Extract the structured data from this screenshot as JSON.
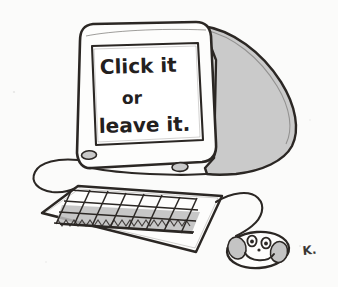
{
  "artwork": {
    "title": "Click it or leave it",
    "medium": "hand-drawn pen-and-ink cartoon",
    "background_color": "#fbfbfa",
    "ink_color": "#2b2724",
    "shade_color": "#c9c9c9"
  },
  "monitor": {
    "name": "desktop-computer-monitor",
    "screen_lines": [
      "Click it",
      "or",
      "leave it."
    ],
    "side_panel_color": "#c9c9c9",
    "bezel_color": "#fdfdfc",
    "buttons": [
      {
        "label": "",
        "name": "monitor-button-left"
      },
      {
        "label": "",
        "name": "monitor-button-right"
      }
    ]
  },
  "keyboard": {
    "name": "computer-keyboard",
    "key_rows": 3,
    "key_columns": 8,
    "key_shade_color": "#b9b9b9"
  },
  "mouse": {
    "name": "computer-mouse",
    "face": "smiley",
    "eyes": 2,
    "has_nose": true,
    "has_smile": true,
    "shade_color": "#c4c4c4"
  },
  "signature": {
    "name": "artist-signature",
    "text": "K."
  }
}
